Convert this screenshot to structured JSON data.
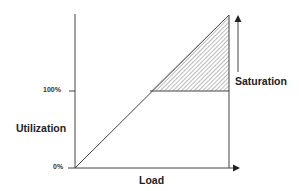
{
  "diagram": {
    "y_axis_label": "Utilization",
    "x_axis_label": "Load",
    "y_ticks": [
      {
        "label": "100%"
      },
      {
        "label": "0%"
      }
    ],
    "annotation": "Saturation",
    "colors": {
      "line": "#444444",
      "hatch": "#555555",
      "text": "#222222",
      "background": "#ffffff"
    }
  }
}
